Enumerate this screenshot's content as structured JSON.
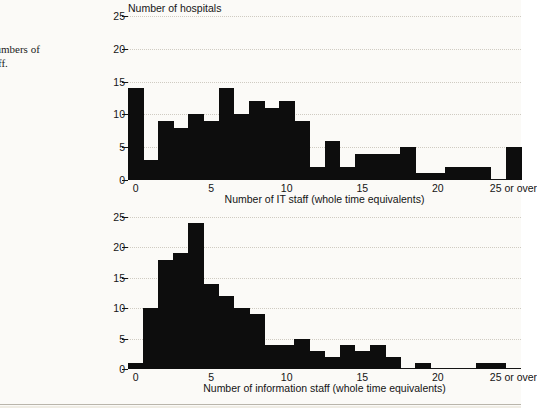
{
  "margin": {
    "figure_label": "f",
    "caption_line1": "numbers of",
    "caption_line2": "taff."
  },
  "chart_data": [
    {
      "id": "chart1",
      "type": "bar",
      "title": "",
      "ylabel": "Number of hospitals",
      "xlabel": "Number of IT staff (whole time equivalents)",
      "ylim": [
        0,
        25
      ],
      "yticks": [
        0,
        5,
        10,
        15,
        20,
        25
      ],
      "ytick_labels": [
        "0",
        "5",
        "10",
        "15",
        "20",
        "25"
      ],
      "xlim": [
        0,
        26
      ],
      "xticks": [
        0,
        5,
        10,
        15,
        20,
        25
      ],
      "xtick_labels": [
        "0",
        "5",
        "10",
        "15",
        "20",
        "25 or over"
      ],
      "grid": true,
      "legend": "none",
      "bin_width": 1,
      "categories": [
        0,
        1,
        2,
        3,
        4,
        5,
        6,
        7,
        8,
        9,
        10,
        11,
        12,
        13,
        14,
        15,
        16,
        17,
        18,
        19,
        20,
        21,
        22,
        23,
        24,
        25
      ],
      "values": [
        14,
        3,
        9,
        8,
        10,
        9,
        14,
        10,
        12,
        11,
        12,
        9,
        2,
        6,
        2,
        4,
        4,
        4,
        5,
        1,
        1,
        2,
        2,
        2,
        0,
        5
      ]
    },
    {
      "id": "chart2",
      "type": "bar",
      "title": "",
      "ylabel": "",
      "xlabel": "Number of information staff (whole time equivalents)",
      "ylim": [
        0,
        25
      ],
      "yticks": [
        0,
        5,
        10,
        15,
        20,
        25
      ],
      "ytick_labels": [
        "0",
        "5",
        "10",
        "15",
        "20",
        "25"
      ],
      "xlim": [
        0,
        26
      ],
      "xticks": [
        0,
        5,
        10,
        15,
        20,
        25
      ],
      "xtick_labels": [
        "0",
        "5",
        "10",
        "15",
        "20",
        "25 or over"
      ],
      "grid": true,
      "legend": "none",
      "bin_width": 1,
      "categories": [
        0,
        1,
        2,
        3,
        4,
        5,
        6,
        7,
        8,
        9,
        10,
        11,
        12,
        13,
        14,
        15,
        16,
        17,
        18,
        19,
        20,
        21,
        22,
        23,
        24,
        25
      ],
      "values": [
        1,
        10,
        18,
        19,
        24,
        14,
        12,
        10,
        9,
        4,
        4,
        5,
        3,
        2,
        4,
        3,
        4,
        2,
        0,
        1,
        0,
        0,
        0,
        1,
        1,
        0
      ]
    }
  ],
  "colors": {
    "bar": "#0d0d0d",
    "axis": "#151515",
    "grid": "#cfcbc2",
    "page_bg": "#fbfaf7",
    "text": "#141414"
  }
}
